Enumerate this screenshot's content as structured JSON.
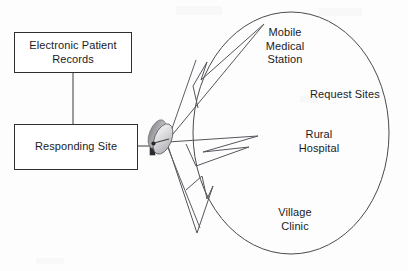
{
  "diagram": {
    "type": "telemedicine-network-diagram",
    "background_color": "#fdfdfd",
    "stroke_color": "#2f2f33",
    "text_color": "#1b1b1f",
    "nodes": [
      {
        "id": "electronic-patient-records",
        "label": "Electronic Patient\nRecords",
        "shape": "rectangle"
      },
      {
        "id": "responding-site",
        "label": "Responding Site",
        "shape": "rectangle"
      }
    ],
    "equipment": {
      "satellite_dish": {
        "name": "satellite-dish-icon",
        "description": "parabolic dish antenna with feed horn"
      }
    },
    "cloud": {
      "name": "request-sites-cloud",
      "shape": "ellipse",
      "group_label": "Request Sites",
      "members": [
        {
          "id": "mobile-medical-station",
          "label": "Mobile\nMedical\nStation"
        },
        {
          "id": "rural-hospital",
          "label": "Rural\nHospital"
        },
        {
          "id": "village-clinic",
          "label": "Village\nClinic"
        }
      ]
    },
    "connections": [
      {
        "id": "epr-to-responding-site",
        "style": "straight-line",
        "from": "electronic-patient-records",
        "to": "responding-site"
      },
      {
        "id": "responding-site-to-dish",
        "style": "straight-line",
        "from": "responding-site",
        "to": "satellite-dish"
      },
      {
        "id": "dish-to-mobile-medical-station",
        "style": "lightning-bolt",
        "from": "satellite-dish",
        "to": "mobile-medical-station"
      },
      {
        "id": "dish-to-rural-hospital",
        "style": "lightning-bolt",
        "from": "satellite-dish",
        "to": "rural-hospital"
      },
      {
        "id": "dish-to-village-clinic",
        "style": "lightning-bolt",
        "from": "satellite-dish",
        "to": "village-clinic"
      }
    ]
  }
}
